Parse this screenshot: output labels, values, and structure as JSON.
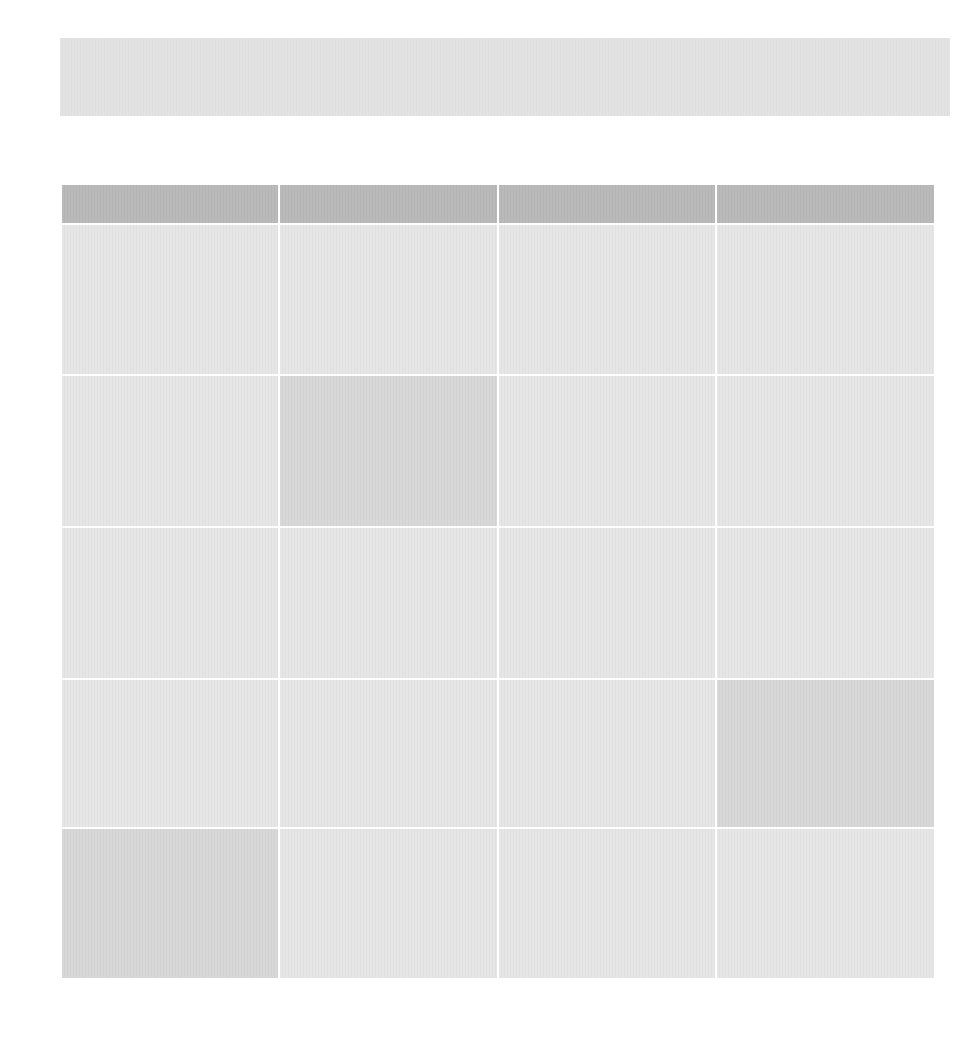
{
  "banner": {
    "text": ""
  },
  "table": {
    "columns": 4,
    "rows": 5,
    "headers": [
      "",
      "",
      "",
      ""
    ],
    "cells": [
      [
        "",
        "",
        "",
        ""
      ],
      [
        "",
        "",
        "",
        ""
      ],
      [
        "",
        "",
        "",
        ""
      ],
      [
        "",
        "",
        "",
        ""
      ],
      [
        "",
        "",
        "",
        ""
      ]
    ],
    "highlighted_cells": [
      {
        "row": 1,
        "col": 1
      },
      {
        "row": 3,
        "col": 3
      },
      {
        "row": 4,
        "col": 0
      }
    ]
  },
  "colors": {
    "banner": "#e2e2e2",
    "header": "#b8b8b8",
    "cell": "#e4e4e4",
    "highlight": "#d6d6d6",
    "divider": "#ffffff"
  }
}
